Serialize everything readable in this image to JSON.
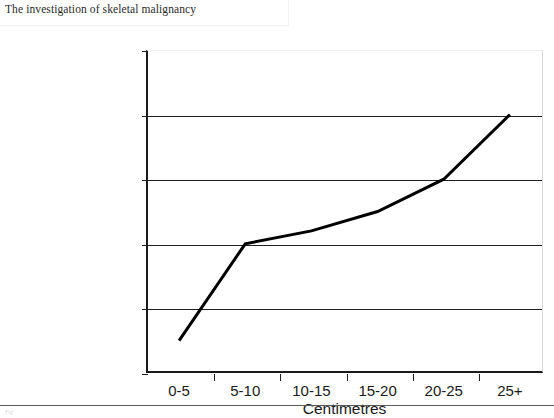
{
  "header": {
    "title": "The investigation of skeletal malignancy"
  },
  "footer": {
    "mark": "Fig"
  },
  "chart_data": {
    "type": "line",
    "title": "",
    "categories": [
      "0-5",
      "5-10",
      "10-15",
      "15-20",
      "20-25",
      "25+"
    ],
    "values": [
      2.5,
      10.0,
      11.0,
      12.5,
      15.0,
      20.0
    ],
    "series": [
      {
        "name": "Percentage",
        "values": [
          2.5,
          10.0,
          11.0,
          12.5,
          15.0,
          20.0
        ]
      }
    ],
    "xlabel": "Centimetres",
    "ylabel": "",
    "ylim": [
      0,
      25
    ],
    "yticks": [
      0,
      5,
      10,
      15,
      20,
      25
    ],
    "ytick_labels": [
      "0.00%",
      "5.00%",
      "10.00%",
      "15.00%",
      "20.00%",
      "25.00%"
    ],
    "grid": true,
    "grid_axis": "y",
    "legend": false,
    "line_color": "#000000",
    "line_width": 3,
    "markers": false
  }
}
